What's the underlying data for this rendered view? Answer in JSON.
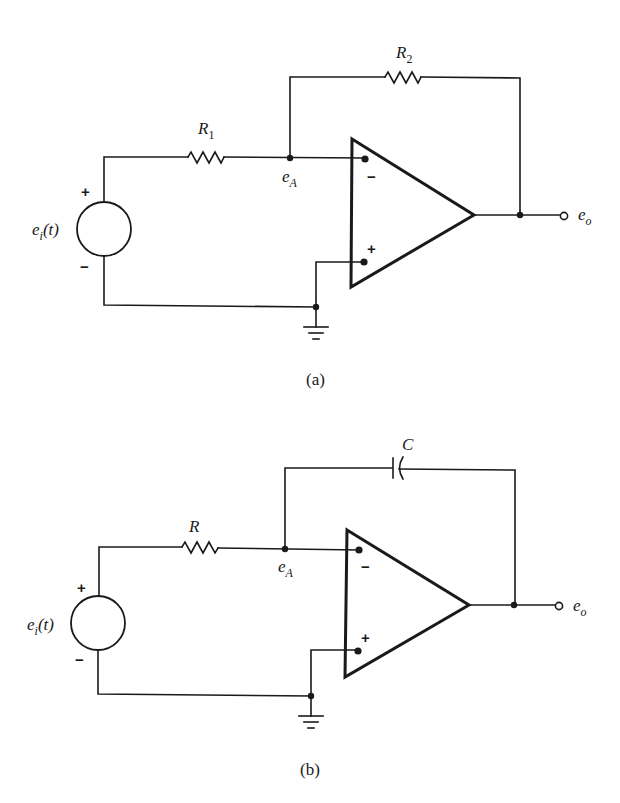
{
  "figure": {
    "panels": [
      {
        "id": "a",
        "caption": "(a)",
        "description": "Inverting amplifier",
        "source_label": {
          "main": "e",
          "sub": "i",
          "rest": "(t)"
        },
        "source_plus": "+",
        "source_minus": "−",
        "input_component": {
          "type": "resistor",
          "label": "R",
          "sub": "1"
        },
        "feedback_component": {
          "type": "resistor",
          "label": "R",
          "sub": "2"
        },
        "node_label": {
          "main": "e",
          "sub": "A"
        },
        "opamp_inverting_sign": "−",
        "opamp_noninverting_sign": "+",
        "output_label": {
          "main": "e",
          "sub": "o"
        }
      },
      {
        "id": "b",
        "caption": "(b)",
        "description": "Integrator",
        "source_label": {
          "main": "e",
          "sub": "i",
          "rest": "(t)"
        },
        "source_plus": "+",
        "source_minus": "−",
        "input_component": {
          "type": "resistor",
          "label": "R",
          "sub": ""
        },
        "feedback_component": {
          "type": "capacitor",
          "label": "C",
          "sub": ""
        },
        "node_label": {
          "main": "e",
          "sub": "A"
        },
        "opamp_inverting_sign": "−",
        "opamp_noninverting_sign": "+",
        "output_label": {
          "main": "e",
          "sub": "o"
        }
      }
    ]
  }
}
